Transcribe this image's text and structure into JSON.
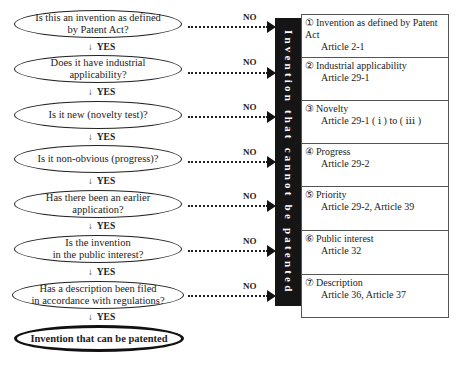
{
  "questions": [
    {
      "text": "Is this an invention as defined by Patent Act?",
      "lines": [
        "Is this an invention as defined",
        "by Patent Act?"
      ]
    },
    {
      "text": "Does it have industrial applicability?",
      "lines": [
        "Does it have industrial",
        "applicability?"
      ]
    },
    {
      "text": "Is it new (novelty test)?",
      "lines": [
        "Is it new (novelty test)?"
      ]
    },
    {
      "text": "Is it non-obvious (progress)?",
      "lines": [
        "Is it non-obvious (progress)?"
      ]
    },
    {
      "text": "Has there been an earlier application?",
      "lines": [
        "Has there been an earlier",
        "application?"
      ]
    },
    {
      "text": "Is the invention in the public interest?",
      "lines": [
        "Is the invention",
        "in the public interest?"
      ]
    },
    {
      "text": "Has a description been filed in accordance with regulations?",
      "lines": [
        "Has a description been filed",
        "in accordance with regulations?"
      ]
    }
  ],
  "yes_label": "YES",
  "yes_arrow": "↓",
  "no_label": "NO",
  "final_result": "Invention that can be patented",
  "rejection_bar": "Invention that cannot be patented",
  "criteria": [
    {
      "num": "①",
      "title": "Invention as defined by Patent Act",
      "article": "Article 2-1"
    },
    {
      "num": "②",
      "title": "Industrial applicability",
      "article": "Article 29-1"
    },
    {
      "num": "③",
      "title": "Novelty",
      "article": "Article 29-1 ( ⅰ ) to ( ⅲ )"
    },
    {
      "num": "④",
      "title": "Progress",
      "article": "Article 29-2"
    },
    {
      "num": "⑤",
      "title": "Priority",
      "article": "Article 29-2, Article 39"
    },
    {
      "num": "⑥",
      "title": "Public interest",
      "article": "Article 32"
    },
    {
      "num": "⑦",
      "title": "Description",
      "article": "Article 36, Article 37"
    }
  ]
}
